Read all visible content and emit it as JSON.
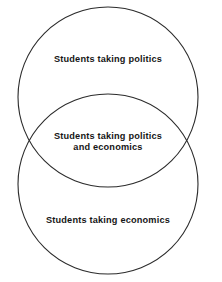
{
  "diagram": {
    "type": "venn",
    "title": "",
    "background_color": "#ffffff",
    "stroke_color": "#2b2b2b",
    "text_color": "#161616",
    "sets": [
      {
        "id": "politics",
        "label": "Students taking politics",
        "region": "top-circle-only",
        "center_x": 108,
        "center_y": 97,
        "radius": 90
      },
      {
        "id": "economics",
        "label": "Students taking economics",
        "region": "bottom-circle-only",
        "center_x": 108,
        "center_y": 184,
        "radius": 90
      }
    ],
    "intersection": {
      "id": "politics-and-economics",
      "label": "Students taking politics\nand economics",
      "region": "overlap"
    }
  }
}
